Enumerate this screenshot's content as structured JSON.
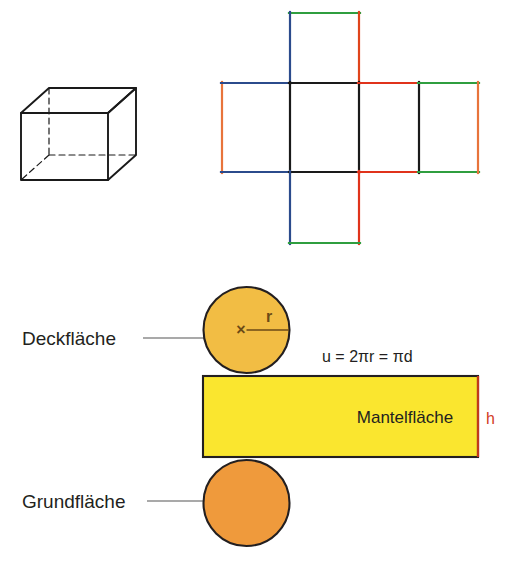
{
  "page": {
    "background": "#ffffff",
    "width": 513,
    "height": 569,
    "language": "de"
  },
  "figures": {
    "cuboid": {
      "name": "Quader (Wuerfel) Schraegbild",
      "stroke": "#1a1a1a",
      "hidden_edge_style": "dashed"
    },
    "cube_net": {
      "name": "Wuerfelnetz",
      "faces_count": 6,
      "edge_colors": {
        "black": "#1a1a1a",
        "blue": "#2b4b8c",
        "green": "#2f9e3f",
        "red": "#e0331b",
        "orange": "#e8743b"
      }
    },
    "cylinder_net": {
      "name": "Zylindernetz",
      "top_circle_fill": "#f2bd44",
      "bottom_circle_fill": "#ef9a3c",
      "rectangle_fill": "#fae62f",
      "outline": "#231f20",
      "h_edge_color": "#c0381c"
    }
  },
  "labels": {
    "deckflaeche": "Deckfläche",
    "grundflaeche": "Grundfläche",
    "mantelflaeche": "Mantelfläche",
    "radius": "r",
    "height": "h",
    "center_marker": "×",
    "formula_umfang": "u = 2πr = πd"
  }
}
